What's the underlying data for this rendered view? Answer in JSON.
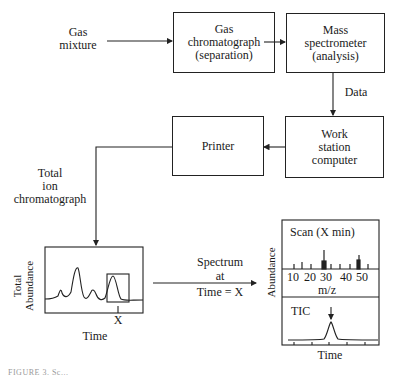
{
  "diagram": {
    "input_label": [
      "Gas",
      "mixture"
    ],
    "boxes": {
      "gc": [
        "Gas",
        "chromatograph",
        "(separation)"
      ],
      "ms": [
        "Mass",
        "spectrometer",
        "(analysis)"
      ],
      "workstation": [
        "Work",
        "station",
        "computer"
      ],
      "printer": [
        "Printer"
      ]
    },
    "edge_labels": {
      "data": "Data",
      "tic": [
        "Total",
        "ion",
        "chromatograph"
      ],
      "spectrum": [
        "Spectrum",
        "at",
        "Time = X"
      ]
    },
    "tic_panel": {
      "ylabel": [
        "Total",
        "Abundance"
      ],
      "xlabel": "Time",
      "marker": "X"
    },
    "spectrum_panel": {
      "ylabel": "Abundance",
      "scan_title": "Scan (X min)",
      "mz_ticks": [
        "10",
        "20",
        "30",
        "40",
        "50"
      ],
      "mz_label": "m/z",
      "tic_title": "TIC",
      "xlabel": "Time"
    },
    "caption": "FIGURE 3. Sc..."
  }
}
